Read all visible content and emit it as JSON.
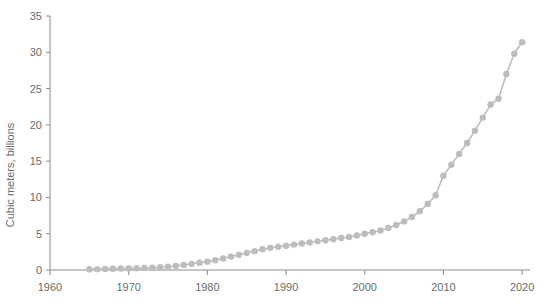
{
  "chart_data": {
    "type": "line",
    "title": "",
    "subtitle": "",
    "xlabel": "",
    "ylabel": "Cubic meters, billions",
    "xlim": [
      1960,
      2021
    ],
    "ylim": [
      0,
      35
    ],
    "grid": false,
    "legend": null,
    "marker": "circle",
    "colors": {
      "series": "#bdbdbd",
      "axis": "#8a8a8a",
      "text": "#6b6b6b",
      "background": "#ffffff"
    },
    "xticks": [
      1960,
      1970,
      1980,
      1990,
      2000,
      2010,
      2020
    ],
    "xtick_labels": [
      "1960",
      "1970",
      "1980",
      "1990",
      "2000",
      "2010",
      "2020"
    ],
    "yticks": [
      0,
      5,
      10,
      15,
      20,
      25,
      30,
      35
    ],
    "ytick_labels": [
      "0",
      "5",
      "10",
      "15",
      "20",
      "25",
      "30",
      "35"
    ],
    "x": [
      1965,
      1966,
      1967,
      1968,
      1969,
      1970,
      1971,
      1972,
      1973,
      1974,
      1975,
      1976,
      1977,
      1978,
      1979,
      1980,
      1981,
      1982,
      1983,
      1984,
      1985,
      1986,
      1987,
      1988,
      1989,
      1990,
      1991,
      1992,
      1993,
      1994,
      1995,
      1996,
      1997,
      1998,
      1999,
      2000,
      2001,
      2002,
      2003,
      2004,
      2005,
      2006,
      2007,
      2008,
      2009,
      2010,
      2011,
      2012,
      2013,
      2014,
      2015,
      2016,
      2017,
      2018,
      2019,
      2020
    ],
    "values": [
      0.1,
      0.12,
      0.15,
      0.18,
      0.2,
      0.22,
      0.25,
      0.28,
      0.32,
      0.38,
      0.45,
      0.55,
      0.7,
      0.85,
      1.0,
      1.15,
      1.35,
      1.6,
      1.85,
      2.1,
      2.35,
      2.6,
      2.85,
      3.05,
      3.2,
      3.35,
      3.5,
      3.65,
      3.8,
      3.95,
      4.1,
      4.25,
      4.4,
      4.55,
      4.75,
      5.0,
      5.2,
      5.45,
      5.8,
      6.2,
      6.7,
      7.3,
      8.1,
      9.1,
      10.3,
      13.0,
      14.5,
      16.0,
      17.5,
      19.2,
      21.0,
      22.8,
      23.6,
      27.0,
      29.8,
      31.4
    ],
    "series": [
      {
        "name": "Cubic meters, billions",
        "values": [
          0.1,
          0.12,
          0.15,
          0.18,
          0.2,
          0.22,
          0.25,
          0.28,
          0.32,
          0.38,
          0.45,
          0.55,
          0.7,
          0.85,
          1.0,
          1.15,
          1.35,
          1.6,
          1.85,
          2.1,
          2.35,
          2.6,
          2.85,
          3.05,
          3.2,
          3.35,
          3.5,
          3.65,
          3.8,
          3.95,
          4.1,
          4.25,
          4.4,
          4.55,
          4.75,
          5.0,
          5.2,
          5.45,
          5.8,
          6.2,
          6.7,
          7.3,
          8.1,
          9.1,
          10.3,
          13.0,
          14.5,
          16.0,
          17.5,
          19.2,
          21.0,
          22.8,
          23.6,
          27.0,
          29.8,
          31.4
        ]
      }
    ]
  }
}
